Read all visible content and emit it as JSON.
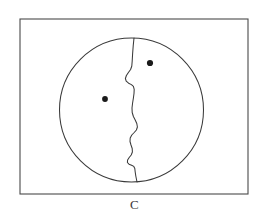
{
  "figure": {
    "caption": "C",
    "colors": {
      "background": "#ffffff",
      "frame_stroke": "#4a4a4a",
      "outline_stroke": "#3a3a3a",
      "marker_fill": "#1a1a1a"
    },
    "frame": {
      "x": 20,
      "y": 19,
      "width": 228,
      "height": 175
    },
    "circle": {
      "cx": 131.5,
      "cy": 110,
      "r": 72
    },
    "divider": {
      "top_point": [
        134,
        38
      ],
      "bottom_point": [
        137,
        182
      ],
      "path": "M 134 38 L 133.2 46 L 132.6 54 L 132.2 61 L 131.8 66 L 130.6 69.5 L 128.4 72.5 L 126.4 75.5 L 125.4 78.5 L 126.2 81.2 L 128.6 83.2 L 131.4 84.6 L 133.4 86.4 L 134.2 89.4 L 134.0 93.5 L 133.4 98 L 132.6 103 L 132.0 108 L 132.2 112.5 L 133.4 116.5 L 135.2 120 L 136.8 123.5 L 137.4 127 L 136.4 130 L 134.2 132.5 L 131.8 135 L 130.2 138 L 130.0 141.5 L 131.0 145 L 132.2 148.5 L 132.4 152 L 131.2 155 L 129.2 157.5 L 127.6 160 L 127.4 162.5 L 129.0 164.2 L 131.6 165.2 L 133.8 166.4 L 134.8 168.5 L 135.2 172 L 135.8 176 L 136.6 180 L 137 182"
    },
    "markers": [
      {
        "name": "left-region-point",
        "cx": 105,
        "cy": 99,
        "r": 2.9
      },
      {
        "name": "right-region-point",
        "cx": 150,
        "cy": 63,
        "r": 3.1
      }
    ]
  }
}
